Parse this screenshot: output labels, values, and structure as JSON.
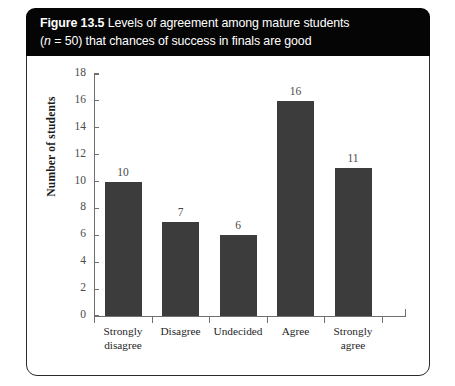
{
  "figure": {
    "title_label": "Figure 13.5",
    "title_line1_rest": "Levels of agreement among mature students",
    "title_line2_prefix": "(",
    "title_line2_n": "n",
    "title_line2_rest": " = 50) that chances of success in finals are good"
  },
  "chart_data": {
    "type": "bar",
    "title": "Figure 13.5 Levels of agreement among mature students (n = 50) that chances of success in finals are good",
    "categories": [
      "Strongly disagree",
      "Disagree",
      "Undecided",
      "Agree",
      "Strongly agree"
    ],
    "category_lines": [
      [
        "Strongly",
        "disagree"
      ],
      [
        "Disagree"
      ],
      [
        "Undecided"
      ],
      [
        "Agree"
      ],
      [
        "Strongly",
        "agree"
      ]
    ],
    "values": [
      10,
      7,
      6,
      16,
      11
    ],
    "value_labels": [
      "10",
      "7",
      "6",
      "16",
      "11"
    ],
    "xlabel": "",
    "ylabel": "Number of students",
    "ylim": [
      0,
      18
    ],
    "ytick_step": 2,
    "yticks": [
      0,
      2,
      4,
      6,
      8,
      10,
      12,
      14,
      16,
      18
    ],
    "ytick_labels": [
      "0",
      "2",
      "4",
      "6",
      "8",
      "10",
      "12",
      "14",
      "16",
      "18"
    ],
    "grid": false,
    "legend": false,
    "bar_color": "#3c3c3c",
    "axis_color": "#6f6f6f",
    "n_total": 50
  }
}
